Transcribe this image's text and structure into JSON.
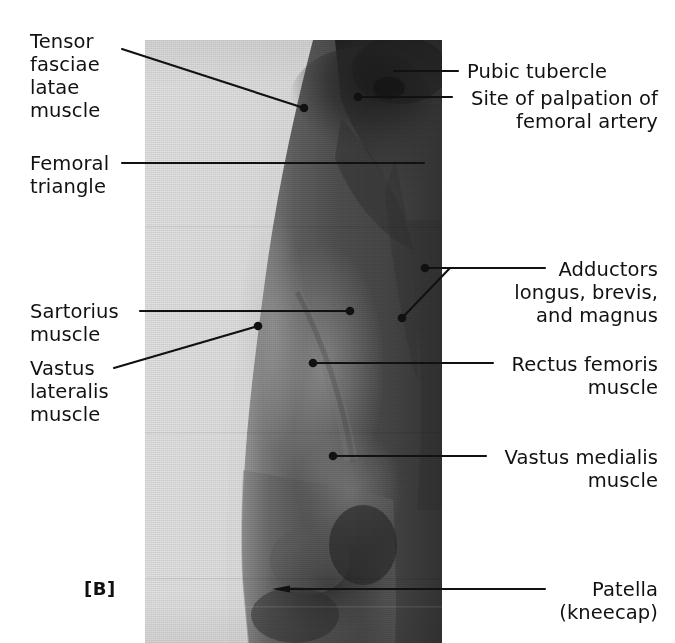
{
  "figure": {
    "panel_letter": "[B]"
  },
  "photo": {
    "alt": "photograph of right anterior thigh, knee to groin",
    "bounds": {
      "x": 145,
      "y": 40,
      "width": 297,
      "height": 603
    },
    "backdrop_color": "#dfdfdf",
    "skin_dark": "#3b3b3b",
    "skin_mid": "#5e5e5e",
    "skin_light": "#8d8d8d"
  },
  "labels": [
    {
      "id": "tensor-fasciae-latae",
      "text": "Tensor\nfasciae\nlatae\nmuscle",
      "side": "left",
      "align": "left",
      "x": 30,
      "y": 30,
      "leader": {
        "from": [
          122,
          49
        ],
        "to": [
          304,
          108
        ],
        "marker": "dot"
      }
    },
    {
      "id": "femoral-triangle",
      "text": "Femoral\ntriangle",
      "side": "left",
      "align": "left",
      "x": 30,
      "y": 152,
      "leader": {
        "from": [
          122,
          163
        ],
        "to": [
          424,
          163
        ],
        "marker": "none"
      }
    },
    {
      "id": "pubic-tubercle",
      "text": "Pubic tubercle",
      "side": "right",
      "align": "left",
      "x": 467,
      "y": 60,
      "leader": {
        "from": [
          458,
          71
        ],
        "to": [
          394,
          71
        ],
        "marker": "none"
      }
    },
    {
      "id": "site-of-palpation-femoral-artery",
      "text": "Site of  palpation of\nfemoral artery",
      "side": "right",
      "align": "right",
      "x": 458,
      "y": 87,
      "leader": {
        "from": [
          452,
          97
        ],
        "to": [
          358,
          97
        ],
        "marker": "dot"
      }
    },
    {
      "id": "adductors",
      "text": "Adductors\nlongus, brevis,\nand magnus",
      "side": "right",
      "align": "left",
      "x": 553,
      "y": 258,
      "leader": {
        "from": [
          545,
          268
        ],
        "to": [
          425,
          268
        ],
        "marker": "dot",
        "branch": {
          "from": [
            450,
            268
          ],
          "to": [
            402,
            318
          ],
          "marker": "dot"
        }
      }
    },
    {
      "id": "sartorius",
      "text": "Sartorius\nmuscle",
      "side": "left",
      "align": "left",
      "x": 30,
      "y": 300,
      "leader": {
        "from": [
          140,
          311
        ],
        "to": [
          350,
          311
        ],
        "marker": "dot"
      }
    },
    {
      "id": "vastus-lateralis",
      "text": "Vastus\nlateralis\nmuscle",
      "side": "left",
      "align": "left",
      "x": 30,
      "y": 357,
      "leader": {
        "from": [
          114,
          368
        ],
        "to": [
          258,
          326
        ],
        "marker": "dot"
      }
    },
    {
      "id": "rectus-femoris",
      "text": "Rectus femoris\nmuscle",
      "side": "right",
      "align": "right",
      "x": 500,
      "y": 353,
      "leader": {
        "from": [
          493,
          363
        ],
        "to": [
          313,
          363
        ],
        "marker": "dot"
      }
    },
    {
      "id": "vastus-medialis",
      "text": "Vastus medialis\nmuscle",
      "side": "right",
      "align": "right",
      "x": 493,
      "y": 446,
      "leader": {
        "from": [
          486,
          456
        ],
        "to": [
          333,
          456
        ],
        "marker": "dot"
      }
    },
    {
      "id": "patella",
      "text": "Patella\n(kneecap)",
      "side": "right",
      "align": "left",
      "x": 553,
      "y": 578,
      "leader": {
        "from": [
          545,
          589
        ],
        "to": [
          272,
          589
        ],
        "marker": "taper"
      }
    }
  ],
  "style": {
    "line_color": "#111111",
    "text_color": "#111111",
    "line_width": 2.1
  }
}
